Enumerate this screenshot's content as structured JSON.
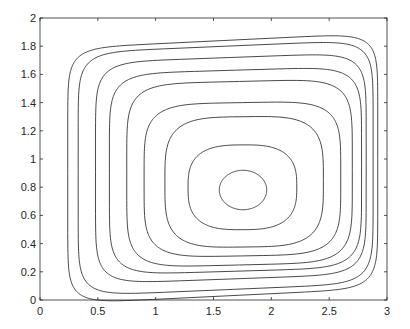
{
  "chart_data": {
    "type": "line",
    "title": "",
    "xlabel": "",
    "ylabel": "",
    "xlim": [
      0,
      3
    ],
    "ylim": [
      0,
      2
    ],
    "grid": false,
    "legend": null,
    "x_ticks": [
      "0",
      "0.5",
      "1",
      "1.5",
      "2",
      "2.5",
      "3"
    ],
    "y_ticks": [
      "0",
      "0.2",
      "0.4",
      "0.6",
      "0.8",
      "1",
      "1.2",
      "1.4",
      "1.6",
      "1.8",
      "2"
    ],
    "series": [
      {
        "name": "orbit 1",
        "center": [
          1.75,
          0.78
        ],
        "x_range": [
          1.55,
          1.96
        ],
        "y_range": [
          0.64,
          0.92
        ]
      },
      {
        "name": "orbit 2",
        "center": [
          1.72,
          0.79
        ],
        "x_range": [
          1.28,
          2.22
        ],
        "y_range": [
          0.5,
          1.1
        ]
      },
      {
        "name": "orbit 3",
        "center": [
          1.7,
          0.8
        ],
        "x_range": [
          1.08,
          2.45
        ],
        "y_range": [
          0.38,
          1.3
        ]
      },
      {
        "name": "orbit 4",
        "center": [
          1.68,
          0.82
        ],
        "x_range": [
          0.9,
          2.6
        ],
        "y_range": [
          0.32,
          1.4
        ]
      },
      {
        "name": "orbit 5",
        "center": [
          1.65,
          0.85
        ],
        "x_range": [
          0.75,
          2.7
        ],
        "y_range": [
          0.26,
          1.55
        ]
      },
      {
        "name": "orbit 6",
        "center": [
          1.62,
          0.88
        ],
        "x_range": [
          0.6,
          2.78
        ],
        "y_range": [
          0.22,
          1.63
        ]
      },
      {
        "name": "orbit 7",
        "center": [
          1.6,
          0.92
        ],
        "x_range": [
          0.48,
          2.82
        ],
        "y_range": [
          0.17,
          1.72
        ]
      },
      {
        "name": "orbit 8",
        "center": [
          1.58,
          0.94
        ],
        "x_range": [
          0.33,
          2.88
        ],
        "y_range": [
          0.1,
          1.8
        ]
      },
      {
        "name": "orbit 9",
        "center": [
          1.55,
          0.95
        ],
        "x_range": [
          0.24,
          2.92
        ],
        "y_range": [
          0.06,
          1.84
        ]
      }
    ]
  }
}
